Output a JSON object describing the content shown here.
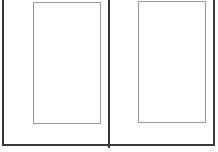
{
  "diagram": {
    "type": "two-page-layout",
    "colors": {
      "frame": "#3a3a3a",
      "panel_border": "#9a9a9a",
      "background": "#ffffff"
    },
    "pages": [
      {
        "name": "left-page",
        "label": ""
      },
      {
        "name": "right-page",
        "label": ""
      }
    ]
  }
}
